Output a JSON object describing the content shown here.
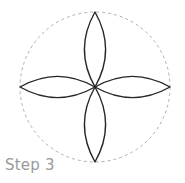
{
  "figure": {
    "title": "Step 3",
    "background_color": "#ffffff",
    "canvas": {
      "width": 185,
      "height": 183
    },
    "guide_circle": {
      "name": "dashed-construction-circle",
      "center_x": 95,
      "center_y": 87,
      "radius": 75,
      "stroke_color": "#b0b0b0",
      "stroke_width": 1,
      "dash_pattern": "3 3",
      "fill": "none"
    },
    "rosette": {
      "name": "four-petal-rosette",
      "petal_count": 4,
      "stroke_color": "#262626",
      "stroke_width": 1.4,
      "fill": "none",
      "petal_half_width": 14,
      "petal_length": 75,
      "petals": [
        {
          "label": "top-petal",
          "angle_deg": 270,
          "tip_x": 95,
          "tip_y": 12
        },
        {
          "label": "right-petal",
          "angle_deg": 0,
          "tip_x": 170,
          "tip_y": 87
        },
        {
          "label": "bottom-petal",
          "angle_deg": 90,
          "tip_x": 95,
          "tip_y": 162
        },
        {
          "label": "left-petal",
          "angle_deg": 180,
          "tip_x": 20,
          "tip_y": 87
        }
      ]
    },
    "caption": {
      "text": "Step 3",
      "color": "#9a9a9a",
      "font_size_px": 15,
      "x": 5,
      "y": 155
    }
  }
}
